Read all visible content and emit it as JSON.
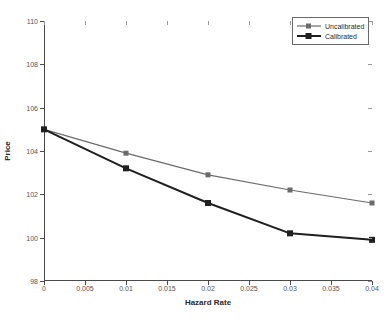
{
  "chart_data": {
    "type": "line",
    "title": "",
    "xlabel": "Hazard Rate",
    "ylabel": "Price",
    "xlim": [
      0,
      0.04
    ],
    "ylim": [
      98,
      110
    ],
    "xticks": [
      0,
      0.005,
      0.01,
      0.015,
      0.02,
      0.025,
      0.03,
      0.035,
      0.04
    ],
    "xticklabels": [
      "0",
      "0.005",
      "0.01",
      "0.015",
      "0.02",
      "0.025",
      "0.03",
      "0.035",
      "0.04"
    ],
    "yticks": [
      98,
      100,
      102,
      104,
      106,
      108,
      110
    ],
    "yticklabels": [
      "98",
      "100",
      "102",
      "104",
      "106",
      "108",
      "110"
    ],
    "grid": false,
    "legend_position": "top-right",
    "x": [
      0,
      0.01,
      0.02,
      0.03,
      0.04
    ],
    "series": [
      {
        "name": "Uncalibrated",
        "values": [
          105.0,
          103.9,
          102.9,
          102.2,
          101.6
        ],
        "color": "#6b6b6b",
        "line_width": 1.2,
        "marker": "square"
      },
      {
        "name": "Calibrated",
        "values": [
          105.0,
          103.2,
          101.6,
          100.2,
          99.9
        ],
        "color": "#1f1f1f",
        "line_width": 2.0,
        "marker": "square"
      }
    ]
  },
  "legend": {
    "entries": [
      {
        "label": "Uncalibrated"
      },
      {
        "label": "Calibrated"
      }
    ]
  },
  "axes": {
    "axis_color": "#4a4a4a",
    "tick_label_color": "#555555",
    "background": "#ffffff"
  }
}
